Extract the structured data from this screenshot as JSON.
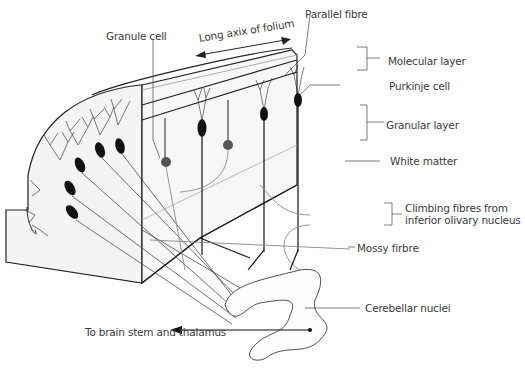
{
  "diagram": {
    "colors": {
      "outline": "#222222",
      "cell_body": "#111111",
      "granule_cell": "#555555",
      "grey_fibre": "#8a8a8a",
      "block_fill": "#f2f2f2",
      "label_text": "#3a3a3a"
    },
    "labels": {
      "granule_cell": "Granule cell",
      "long_axis": "Long axix of folium",
      "parallel_fibre": "Parallel fibre",
      "molecular_layer": "Molecular layer",
      "purkinje_cell": "Purkinje cell",
      "granular_layer": "Granular layer",
      "white_matter": "White matter",
      "climbing_fibres": "Climbing fibres from inferior olivary nucleus",
      "mossy_fibre": "Mossy firbre",
      "cerebellar_nuclei": "Cerebellar nuclei",
      "output": "To brain stem and thalamus"
    }
  }
}
